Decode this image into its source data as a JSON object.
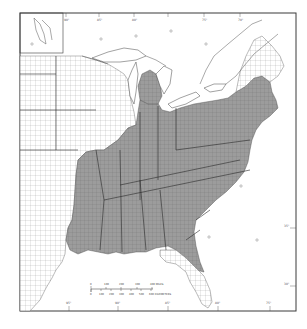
{
  "map": {
    "title": "",
    "region": "Eastern United States",
    "style": "county-level grayscale choropleth",
    "colors": {
      "frame": "#3a3a3a",
      "shaded_fill": "#9a9a9a",
      "unshaded_fill": "#ffffff",
      "county_line": "#6a6a6a",
      "state_line": "#2a2a2a",
      "water": "#ffffff"
    },
    "legend": {
      "shaded": "Shaded counties (eastern / southeastern states)",
      "unshaded": "Unshaded counties"
    },
    "inset": {
      "label": "Upper Great Lakes inset"
    },
    "graticule_labels": {
      "top": [
        "90°",
        "85°",
        "80°",
        "75°",
        "70°"
      ],
      "bottom": [
        "95°",
        "90°",
        "85°",
        "80°",
        "75°"
      ],
      "right": [
        "35°",
        "30°"
      ]
    },
    "scale_bar": {
      "miles_ticks": [
        "0",
        "100",
        "200",
        "300",
        "400 MILES"
      ],
      "km_ticks": [
        "0",
        "100",
        "200",
        "300",
        "400",
        "500",
        "600 KILOMETERS"
      ]
    }
  }
}
